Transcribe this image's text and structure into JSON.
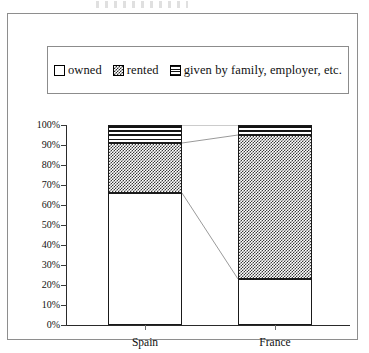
{
  "legend": {
    "entries": [
      {
        "label": "owned",
        "pattern": "empty",
        "swatch_name": "legend-swatch-owned"
      },
      {
        "label": "rented",
        "pattern": "checkerboard",
        "swatch_name": "legend-swatch-rented"
      },
      {
        "label": "given by family, employer, etc.",
        "pattern": "horizontal-stripes",
        "swatch_name": "legend-swatch-given"
      }
    ]
  },
  "axes": {
    "y_ticks": [
      "0%",
      "10%",
      "20%",
      "30%",
      "40%",
      "50%",
      "60%",
      "70%",
      "80%",
      "90%",
      "100%"
    ],
    "x_categories": [
      "Spain",
      "France"
    ]
  },
  "colors": {
    "axis": "#2a2a2a",
    "frame": "#8e8e8e",
    "bar_outline": "#1a1a1a",
    "pattern_dark": "#2b2b2b",
    "background": "#ffffff"
  },
  "chart_data": {
    "type": "bar",
    "title": "",
    "xlabel": "",
    "ylabel": "",
    "stacked": true,
    "normalized_100pct": true,
    "ylim": [
      0,
      100
    ],
    "ytick_step": 10,
    "grid": false,
    "legend_position": "top",
    "categories": [
      "Spain",
      "France"
    ],
    "series": [
      {
        "name": "owned",
        "values": [
          66,
          23
        ]
      },
      {
        "name": "rented",
        "values": [
          25,
          72
        ]
      },
      {
        "name": "given by family, employer, etc.",
        "values": [
          9,
          5
        ]
      }
    ],
    "cumulative_tops": {
      "Spain": {
        "owned": 66,
        "rented": 91,
        "given by family, employer, etc.": 100
      },
      "France": {
        "owned": 23,
        "rented": 95,
        "given by family, employer, etc.": 100
      }
    }
  }
}
